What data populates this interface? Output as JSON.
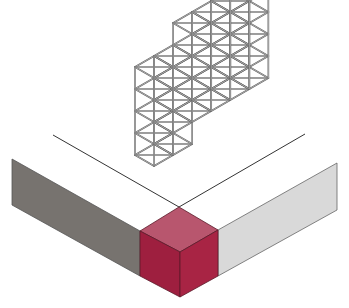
{
  "diagram": {
    "type": "isometric-illustration",
    "elements": {
      "lattice": "wireframe cube lattice structure",
      "corner_cube": "crimson cube at corner",
      "left_bar": "dark gray bar face",
      "right_bar": "light gray bar face"
    },
    "colors": {
      "background": "#ffffff",
      "lattice_stroke": "#5a5a5a",
      "lattice_fill": "#d8d8d8",
      "cube_top": "#b8566e",
      "cube_left": "#9e1f3f",
      "cube_right": "#a82444",
      "left_bar": "#77736f",
      "right_bar": "#d9d9d9",
      "line": "#333333"
    }
  }
}
